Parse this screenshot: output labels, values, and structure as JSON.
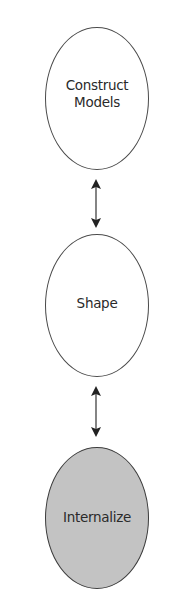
{
  "diagram": {
    "type": "vertical-flow",
    "colors": {
      "outline": "#4a4a4a",
      "text": "#2a2a2a",
      "default_fill": "#ffffff",
      "highlight_fill": "#c3c3c3",
      "arrow": "#333333"
    },
    "nodes": [
      {
        "id": "construct-models",
        "label": "Construct\nModels",
        "highlighted": false
      },
      {
        "id": "shape",
        "label": "Shape",
        "highlighted": false
      },
      {
        "id": "internalize",
        "label": "Internalize",
        "highlighted": true
      }
    ],
    "edges": [
      {
        "from": "construct-models",
        "to": "shape",
        "direction": "bidirectional"
      },
      {
        "from": "shape",
        "to": "internalize",
        "direction": "bidirectional"
      }
    ]
  }
}
